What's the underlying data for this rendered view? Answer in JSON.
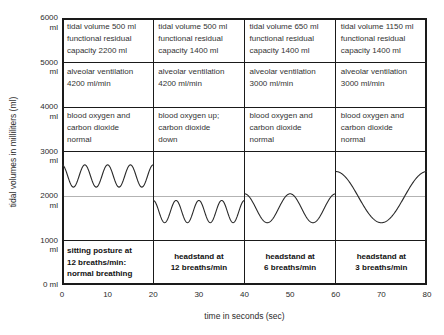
{
  "chart_data": {
    "type": "line",
    "title": "",
    "xlabel": "time in seconds (sec)",
    "ylabel": "tidal volumes in milliliters (ml)",
    "xlim": [
      0,
      80
    ],
    "ylim": [
      0,
      6000
    ],
    "grid": "table-style: horizontal separators at 1000-ml multiples, vertical panel dividers every 20 s",
    "x_ticks": [
      0,
      10,
      20,
      30,
      40,
      50,
      60,
      70,
      80
    ],
    "y_ticks": [
      {
        "value": 6000,
        "label": "6000\nml"
      },
      {
        "value": 5000,
        "label": "5000\nml"
      },
      {
        "value": 4000,
        "label": "4000\nml"
      },
      {
        "value": 3000,
        "label": "3000\nml"
      },
      {
        "value": 2000,
        "label": "2000\nml"
      },
      {
        "value": 1000,
        "label": "1000\nml"
      },
      {
        "value": 0,
        "label": "0 ml"
      }
    ],
    "row_separator_levels_ml": [
      5000,
      4000,
      3000,
      1000
    ],
    "minor_gridline_ml": 2000,
    "panel_boundaries_sec": [
      0,
      20,
      40,
      60,
      80
    ],
    "panels": [
      {
        "t_start": 0,
        "t_end": 20,
        "tidal_volume_ml": 500,
        "functional_residual_capacity_ml": 2200,
        "alveolar_ventilation_ml_min": 4200,
        "breaths_per_min": 12,
        "cycles_shown": 4,
        "wave_min_ml": 2200,
        "wave_max_ml": 2700,
        "cells": {
          "tidal": "tidal volume 500 ml\nfunctional residual\ncapacity 2200 ml",
          "ventilation": "alveolar ventilation\n4200 ml/min",
          "blood": "blood oxygen and\ncarbon dioxide\nnormal",
          "condition": "sitting posture at\n12 breaths/min:\nnormal breathing"
        },
        "condition_align": "left"
      },
      {
        "t_start": 20,
        "t_end": 40,
        "tidal_volume_ml": 500,
        "functional_residual_capacity_ml": 1400,
        "alveolar_ventilation_ml_min": 4200,
        "breaths_per_min": 12,
        "cycles_shown": 4,
        "wave_min_ml": 1400,
        "wave_max_ml": 1900,
        "cells": {
          "tidal": "tidal volume 500 ml\nfunctional residual\ncapacity 1400 ml",
          "ventilation": "alveolar ventilation\n4200 ml/min",
          "blood": "blood oxygen up;\ncarbon dioxide\ndown",
          "condition": "headstand at\n12 breaths/min"
        },
        "condition_align": "center"
      },
      {
        "t_start": 40,
        "t_end": 60,
        "tidal_volume_ml": 650,
        "functional_residual_capacity_ml": 1400,
        "alveolar_ventilation_ml_min": 3000,
        "breaths_per_min": 6,
        "cycles_shown": 2,
        "wave_min_ml": 1400,
        "wave_max_ml": 2050,
        "cells": {
          "tidal": "tidal volume 650 ml\nfunctional residual\ncapacity 1400 ml",
          "ventilation": "alveolar ventilation\n3000 ml/min",
          "blood": "blood oxygen and\ncarbon dioxide\nnormal",
          "condition": "headstand at\n6 breaths/min"
        },
        "condition_align": "center"
      },
      {
        "t_start": 60,
        "t_end": 80,
        "tidal_volume_ml": 1150,
        "functional_residual_capacity_ml": 1400,
        "alveolar_ventilation_ml_min": 3000,
        "breaths_per_min": 3,
        "cycles_shown": 1,
        "wave_min_ml": 1400,
        "wave_max_ml": 2550,
        "cells": {
          "tidal": "tidal volume 1150 ml\nfunctional residual\ncapacity 1400 ml",
          "ventilation": "alveolar ventilation\n3000 ml/min",
          "blood": "blood oxygen and\ncarbon dioxide\nnormal",
          "condition": "headstand at\n3 breaths/min"
        },
        "condition_align": "center"
      }
    ],
    "colors": {
      "line": "#2a2a2a",
      "grid_minor": "#b3b3b3",
      "border": "#1a1a1a",
      "text": "#333333"
    }
  }
}
